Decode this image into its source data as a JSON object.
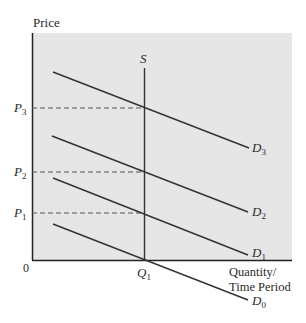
{
  "diagram": {
    "y_axis_label": "Price",
    "x_axis_label_line1": "Quantity/",
    "x_axis_label_line2": "Time Period",
    "origin_label": "0",
    "supply": {
      "label": "S",
      "sub": ""
    },
    "quantity_marker": {
      "label": "Q",
      "sub": "1"
    },
    "price_levels": [
      {
        "label": "P",
        "sub": "3"
      },
      {
        "label": "P",
        "sub": "2"
      },
      {
        "label": "P",
        "sub": "1"
      }
    ],
    "demand_curves": [
      {
        "label": "D",
        "sub": "3"
      },
      {
        "label": "D",
        "sub": "2"
      },
      {
        "label": "D",
        "sub": "1"
      },
      {
        "label": "D",
        "sub": "0"
      }
    ],
    "colors": {
      "panel": "#e6e6e6",
      "line": "#333333",
      "dash": "#555555"
    }
  }
}
